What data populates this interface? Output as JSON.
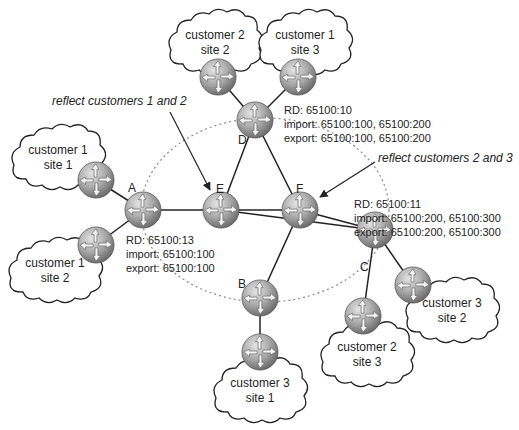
{
  "diagram": {
    "type": "network-topology",
    "dashed_ring": {
      "cx": 265,
      "cy": 210,
      "rx": 124,
      "ry": 92
    },
    "routers": [
      {
        "id": "A",
        "label": "A",
        "x": 143,
        "y": 210,
        "lx": 128,
        "ly": 192
      },
      {
        "id": "B",
        "label": "B",
        "x": 260,
        "y": 298,
        "lx": 238,
        "ly": 288
      },
      {
        "id": "C",
        "label": "C",
        "x": 375,
        "y": 230,
        "lx": 360,
        "ly": 271
      },
      {
        "id": "D",
        "label": "D",
        "x": 255,
        "y": 120,
        "lx": 238,
        "ly": 144
      },
      {
        "id": "E",
        "label": "E",
        "x": 221,
        "y": 210,
        "lx": 216,
        "ly": 193
      },
      {
        "id": "F",
        "label": "F",
        "x": 300,
        "y": 210,
        "lx": 296,
        "ly": 193
      },
      {
        "id": "CE-c2s2",
        "label": "",
        "x": 218,
        "y": 77
      },
      {
        "id": "CE-c1s3",
        "label": "",
        "x": 298,
        "y": 77
      },
      {
        "id": "CE-c1s1",
        "label": "",
        "x": 96,
        "y": 180
      },
      {
        "id": "CE-c1s2",
        "label": "",
        "x": 96,
        "y": 245
      },
      {
        "id": "CE-c3s1",
        "label": "",
        "x": 260,
        "y": 352
      },
      {
        "id": "CE-c2s3",
        "label": "",
        "x": 363,
        "y": 316
      },
      {
        "id": "CE-c3s2",
        "label": "",
        "x": 413,
        "y": 285
      }
    ],
    "links": [
      [
        "A",
        "E"
      ],
      [
        "E",
        "F"
      ],
      [
        "E",
        "D"
      ],
      [
        "D",
        "F"
      ],
      [
        "F",
        "B"
      ],
      [
        "F",
        "C"
      ],
      [
        "E",
        "C"
      ],
      [
        "A",
        "CE-c1s1"
      ],
      [
        "A",
        "CE-c1s2"
      ],
      [
        "D",
        "CE-c2s2"
      ],
      [
        "D",
        "CE-c1s3"
      ],
      [
        "B",
        "CE-c3s1"
      ],
      [
        "C",
        "CE-c2s3"
      ],
      [
        "C",
        "CE-c3s2"
      ]
    ],
    "clouds": [
      {
        "id": "c2s2",
        "line1": "customer 2",
        "line2": "site 2",
        "x": 215,
        "y": 42
      },
      {
        "id": "c1s3",
        "line1": "customer 1",
        "line2": "site 3",
        "x": 305,
        "y": 42
      },
      {
        "id": "c1s1",
        "line1": "customer 1",
        "line2": "site 1",
        "x": 58,
        "y": 157
      },
      {
        "id": "c1s2",
        "line1": "customer 1",
        "line2": "site 2",
        "x": 55,
        "y": 270
      },
      {
        "id": "c3s1",
        "line1": "customer 3",
        "line2": "site 1",
        "x": 260,
        "y": 390
      },
      {
        "id": "c2s3",
        "line1": "customer 2",
        "line2": "site 3",
        "x": 367,
        "y": 354
      },
      {
        "id": "c3s2",
        "line1": "customer 3",
        "line2": "site 2",
        "x": 452,
        "y": 310
      }
    ],
    "annotations": {
      "reflect12": "reflect customers 1 and 2",
      "reflect23": "reflect customers 2 and 3"
    },
    "vrf_D": {
      "rd": "RD: 65100:10",
      "import": "import: 65100:100, 65100:200",
      "export": "export: 65100:100, 65100:200"
    },
    "vrf_C": {
      "rd": "RD: 65100:11",
      "import": "import: 65100:200, 65100:300",
      "export": "export: 65100:200, 65100:300"
    },
    "vrf_A": {
      "rd": "RD: 65100:13",
      "import": "import: 65100:100",
      "export": "export: 65100:100"
    }
  }
}
